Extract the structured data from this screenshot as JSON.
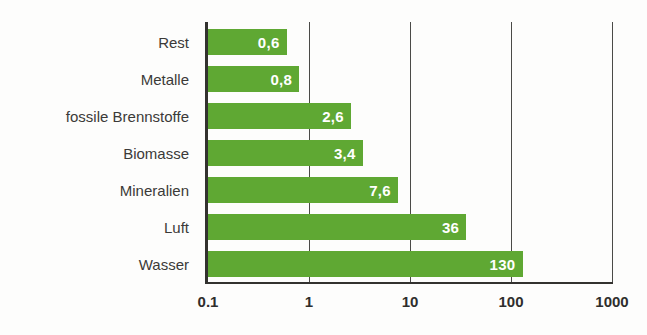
{
  "chart_data": {
    "type": "bar",
    "orientation": "horizontal",
    "title": "",
    "subtitle": "",
    "xlabel": "",
    "ylabel": "",
    "xscale": "log",
    "xlim": [
      0.1,
      1000
    ],
    "xticks": [
      "0.1",
      "1",
      "10",
      "100",
      "1000"
    ],
    "xtick_values": [
      0.1,
      1,
      10,
      100,
      1000
    ],
    "grid": true,
    "legend": null,
    "categories": [
      "Rest",
      "Metalle",
      "fossile Brennstoffe",
      "Biomasse",
      "Mineralien",
      "Luft",
      "Wasser"
    ],
    "values": [
      0.6,
      0.8,
      2.6,
      3.4,
      7.6,
      36,
      130
    ],
    "value_labels": [
      "0,6",
      "0,8",
      "2,6",
      "3,4",
      "7,6",
      "36",
      "130"
    ],
    "bar_color": "#5fa833",
    "value_label_color": "#ffffff",
    "axis_color": "#33322f",
    "bars": [
      {
        "category": "Rest",
        "value": 0.6,
        "label": "0,6"
      },
      {
        "category": "Metalle",
        "value": 0.8,
        "label": "0,8"
      },
      {
        "category": "fossile Brennstoffe",
        "value": 2.6,
        "label": "2,6"
      },
      {
        "category": "Biomasse",
        "value": 3.4,
        "label": "3,4"
      },
      {
        "category": "Mineralien",
        "value": 7.6,
        "label": "7,6"
      },
      {
        "category": "Luft",
        "value": 36,
        "label": "36"
      },
      {
        "category": "Wasser",
        "value": 130,
        "label": "130"
      }
    ]
  }
}
